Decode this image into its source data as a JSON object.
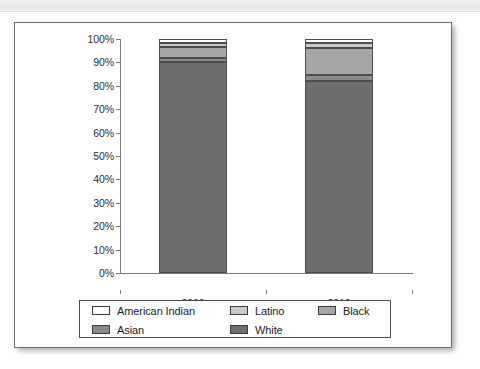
{
  "scan": {
    "header_left": "",
    "header_right": ""
  },
  "chart_data": {
    "type": "bar",
    "stacked": true,
    "normalized_percent": true,
    "title": "",
    "subtitle": "",
    "xlabel": "",
    "ylabel": "",
    "categories": [
      "2000",
      "2010"
    ],
    "ylim": [
      0,
      100
    ],
    "ytick_labels": [
      "0%",
      "10%",
      "20%",
      "30%",
      "40%",
      "50%",
      "60%",
      "70%",
      "80%",
      "90%",
      "100%"
    ],
    "ytick_values": [
      0,
      10,
      20,
      30,
      40,
      50,
      60,
      70,
      80,
      90,
      100
    ],
    "grid": false,
    "legend_position": "bottom",
    "series": [
      {
        "name": "White",
        "values": [
          90.0,
          82.0
        ],
        "color": "#6e6e6e"
      },
      {
        "name": "Asian",
        "values": [
          2.0,
          2.5
        ],
        "color": "#8a8a8a"
      },
      {
        "name": "Black",
        "values": [
          4.5,
          11.5
        ],
        "color": "#a6a6a6"
      },
      {
        "name": "Latino",
        "values": [
          2.0,
          2.5
        ],
        "color": "#c9c9c9"
      },
      {
        "name": "American Indian",
        "values": [
          1.5,
          1.5
        ],
        "color": "#ffffff"
      }
    ],
    "stack_order_bottom_to_top": [
      "White",
      "Asian",
      "Black",
      "Latino",
      "American Indian"
    ]
  },
  "legend": {
    "rows": [
      [
        {
          "label": "American Indian",
          "color": "#ffffff"
        },
        {
          "label": "Latino",
          "color": "#c9c9c9"
        },
        {
          "label": "Black",
          "color": "#a6a6a6"
        }
      ],
      [
        {
          "label": "Asian",
          "color": "#8a8a8a"
        },
        {
          "label": "White",
          "color": "#6e6e6e"
        }
      ]
    ]
  }
}
